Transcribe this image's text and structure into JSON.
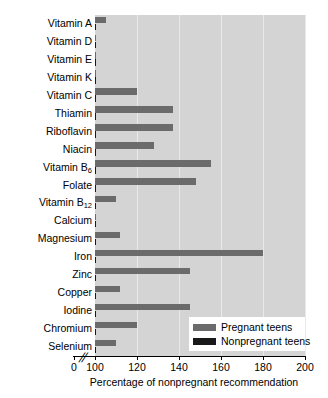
{
  "chart_data": {
    "type": "bar",
    "orientation": "horizontal",
    "title": "",
    "xlabel": "Percentage of nonpregnant recommendation",
    "ylabel": "",
    "xlim": [
      100,
      200
    ],
    "xticks": [
      100,
      120,
      140,
      160,
      180,
      200
    ],
    "xtick_labels": [
      "100",
      "120",
      "140",
      "160",
      "180",
      "200"
    ],
    "origin_label": "0",
    "axis_break": "//",
    "grid": true,
    "grid_axis": "x",
    "legend_position": "lower right",
    "categories": [
      "Vitamin A",
      "Vitamin D",
      "Vitamin E",
      "Vitamin K",
      "Vitamin C",
      "Thiamin",
      "Riboflavin",
      "Niacin",
      "Vitamin B6",
      "Folate",
      "Vitamin B12",
      "Calcium",
      "Magnesium",
      "Iron",
      "Zinc",
      "Copper",
      "Iodine",
      "Chromium",
      "Selenium"
    ],
    "category_labels_html": [
      "Vitamin A",
      "Vitamin D",
      "Vitamin E",
      "Vitamin K",
      "Vitamin C",
      "Thiamin",
      "Riboflavin",
      "Niacin",
      "Vitamin B<sub>6</sub>",
      "Folate",
      "Vitamin B<sub>12</sub>",
      "Calcium",
      "Magnesium",
      "Iron",
      "Zinc",
      "Copper",
      "Iodine",
      "Chromium",
      "Selenium"
    ],
    "series": [
      {
        "name": "Pregnant teens",
        "color": "#6b6b6b",
        "values": [
          105,
          100,
          100,
          100,
          120,
          137,
          137,
          128,
          155,
          148,
          110,
          100,
          112,
          180,
          145,
          112,
          145,
          120,
          110
        ]
      },
      {
        "name": "Nonpregnant teens",
        "color": "#191919",
        "values": [
          100,
          100,
          100,
          100,
          100,
          100,
          100,
          100,
          100,
          100,
          100,
          100,
          100,
          100,
          100,
          100,
          100,
          100,
          100
        ]
      }
    ]
  },
  "legend": {
    "items": [
      {
        "label": "Pregnant teens",
        "color": "#6b6b6b"
      },
      {
        "label": "Nonpregnant teens",
        "color": "#191919"
      }
    ]
  },
  "colors": {
    "plot_background": "#d4d4d4",
    "gridline": "#e9e9e9",
    "pregnant": "#6b6b6b",
    "nonpregnant": "#191919",
    "axis": "#000000",
    "page_background": "#ffffff"
  }
}
